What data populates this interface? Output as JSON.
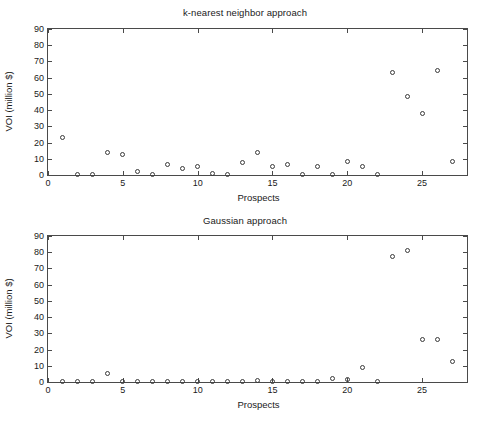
{
  "figure": {
    "background": "#ffffff",
    "axis_color": "#4a4a4a",
    "marker_color": "#3a3a3a"
  },
  "chart_data": [
    {
      "type": "scatter",
      "title": "k-nearest neighbor approach",
      "xlabel": "Prospects",
      "ylabel": "VOI (million $)",
      "xlim": [
        0,
        28
      ],
      "ylim": [
        0,
        90
      ],
      "xticks": [
        0,
        5,
        10,
        15,
        20,
        25
      ],
      "yticks": [
        0,
        10,
        20,
        30,
        40,
        50,
        60,
        70,
        80,
        90
      ],
      "xtick_labels": [
        "0",
        "5",
        "10",
        "15",
        "20",
        "25"
      ],
      "ytick_labels": [
        "0",
        "10",
        "20",
        "30",
        "40",
        "50",
        "60",
        "70",
        "80",
        "90"
      ],
      "grid": false,
      "legend": null,
      "marker": "open-circle",
      "x": [
        1,
        2,
        3,
        4,
        5,
        6,
        7,
        8,
        9,
        10,
        11,
        12,
        13,
        14,
        15,
        16,
        17,
        18,
        19,
        20,
        21,
        22,
        23,
        24,
        25,
        26,
        27
      ],
      "y": [
        23,
        0.3,
        0.3,
        14,
        12.5,
        2,
        0.3,
        6.5,
        4,
        5,
        0.8,
        0.3,
        8,
        14,
        5,
        6.5,
        0.3,
        5.5,
        0.3,
        8.5,
        5,
        0.3,
        63,
        48.5,
        38,
        64.5,
        8.5
      ]
    },
    {
      "type": "scatter",
      "title": "Gaussian approach",
      "xlabel": "Prospects",
      "ylabel": "VOI (million $)",
      "xlim": [
        0,
        28
      ],
      "ylim": [
        0,
        90
      ],
      "xticks": [
        0,
        5,
        10,
        15,
        20,
        25
      ],
      "yticks": [
        0,
        10,
        20,
        30,
        40,
        50,
        60,
        70,
        80,
        90
      ],
      "xtick_labels": [
        "0",
        "5",
        "10",
        "15",
        "20",
        "25"
      ],
      "ytick_labels": [
        "0",
        "10",
        "20",
        "30",
        "40",
        "50",
        "60",
        "70",
        "80",
        "90"
      ],
      "grid": false,
      "legend": null,
      "marker": "open-circle",
      "x": [
        1,
        2,
        3,
        4,
        5,
        6,
        7,
        8,
        9,
        10,
        11,
        12,
        13,
        14,
        15,
        16,
        17,
        18,
        19,
        20,
        21,
        22,
        23,
        24,
        25,
        26,
        27
      ],
      "y": [
        0.3,
        0.3,
        0.3,
        5.5,
        0.6,
        0.4,
        0.4,
        0.4,
        0.4,
        0.6,
        0.4,
        0.4,
        0.4,
        1.2,
        0.6,
        0.4,
        0.4,
        0.4,
        2,
        1.5,
        9,
        0.5,
        77.5,
        81,
        26.5,
        26,
        12.5
      ]
    }
  ]
}
